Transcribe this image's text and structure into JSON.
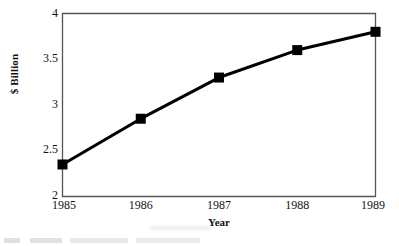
{
  "chart_data": {
    "type": "line",
    "title": "",
    "subtitle": "",
    "xlabel": "Year",
    "ylabel": "$ Billion",
    "categories": [
      "1985",
      "1986",
      "1987",
      "1988",
      "1989"
    ],
    "x": [
      1985,
      1986,
      1987,
      1988,
      1989
    ],
    "values": [
      2.35,
      2.85,
      3.3,
      3.6,
      3.8
    ],
    "series": [
      {
        "name": "",
        "values": [
          2.35,
          2.85,
          3.3,
          3.6,
          3.8
        ]
      }
    ],
    "ylim": [
      2,
      4
    ],
    "xlim": [
      1985,
      1989
    ],
    "yticks": [
      "2",
      "2.5",
      "3",
      "3.5",
      "4"
    ],
    "ytick_values": [
      2,
      2.5,
      3,
      3.5,
      4
    ],
    "xticks": [
      "1985",
      "1986",
      "1987",
      "1988",
      "1989"
    ],
    "grid": false,
    "legend": false,
    "legend_position": "none",
    "marker": "filled-square",
    "line_color": "#000000",
    "marker_color": "#000000",
    "frame_color": "#555555",
    "background_color": "#ffffff",
    "annotations": []
  }
}
